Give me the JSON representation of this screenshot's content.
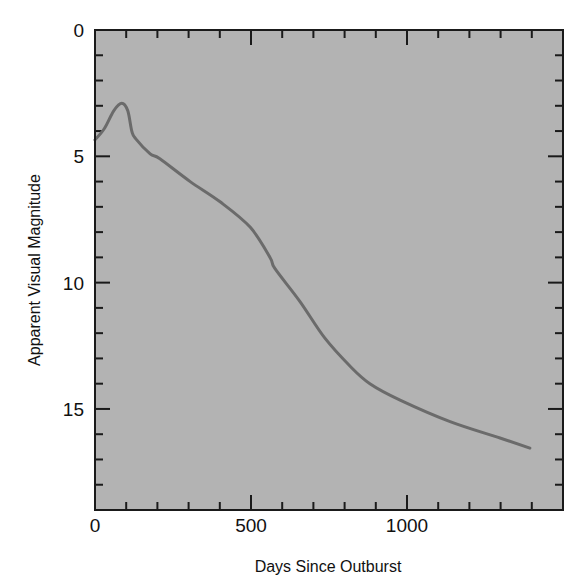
{
  "chart_data": {
    "type": "line",
    "title": "",
    "xlabel": "Days Since Outburst",
    "ylabel": "Apparent Visual Magnitude",
    "xlim": [
      0,
      1500
    ],
    "ylim": [
      0,
      19
    ],
    "y_inverted": true,
    "grid": false,
    "legend": null,
    "x_ticks_major": [
      0,
      500,
      1000
    ],
    "x_tick_labels": [
      "0",
      "500",
      "1000"
    ],
    "x_ticks_minor_step": 100,
    "y_ticks_major": [
      0,
      5,
      10,
      15
    ],
    "y_tick_labels": [
      "0",
      "5",
      "10",
      "15"
    ],
    "y_ticks_minor_step": 1,
    "series": [
      {
        "name": "light curve",
        "x": [
          0,
          30,
          60,
          86,
          105,
          118,
          130,
          177,
          208,
          305,
          401,
          497,
          561,
          577,
          657,
          737,
          817,
          881,
          978,
          1138,
          1298,
          1394
        ],
        "y": [
          4.35,
          3.9,
          3.2,
          2.9,
          3.2,
          4.0,
          4.3,
          4.9,
          5.1,
          6.0,
          6.8,
          7.8,
          9.0,
          9.45,
          10.75,
          12.2,
          13.3,
          14.0,
          14.65,
          15.5,
          16.15,
          16.55
        ]
      }
    ],
    "colors": {
      "plot_background": "#b3b3b3",
      "curve": "#6b6b6b",
      "frame": "#1a1a1a"
    }
  }
}
